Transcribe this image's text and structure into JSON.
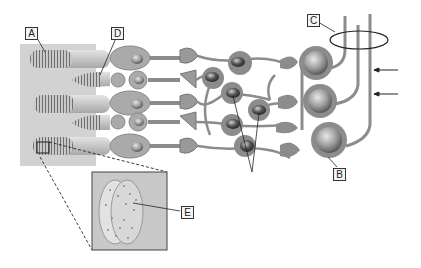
{
  "diagram": {
    "type": "retina-cell-layers",
    "labels": [
      {
        "id": "A",
        "text": "A",
        "x": 25,
        "y": 27
      },
      {
        "id": "B",
        "text": "B",
        "x": 333,
        "y": 168
      },
      {
        "id": "C",
        "text": "C",
        "x": 307,
        "y": 14
      },
      {
        "id": "D",
        "text": "D",
        "x": 111,
        "y": 27
      },
      {
        "id": "E",
        "text": "E",
        "x": 181,
        "y": 206
      }
    ],
    "arrows": [
      {
        "name": "arrow-upper",
        "direction": "left"
      },
      {
        "name": "arrow-lower",
        "direction": "left"
      }
    ],
    "colors": {
      "cell_fill": "#8c8c8c",
      "nucleus": "#5a5a5a",
      "background_panel": "#d2d2d2",
      "inset_panel": "#c8c8c8"
    }
  }
}
